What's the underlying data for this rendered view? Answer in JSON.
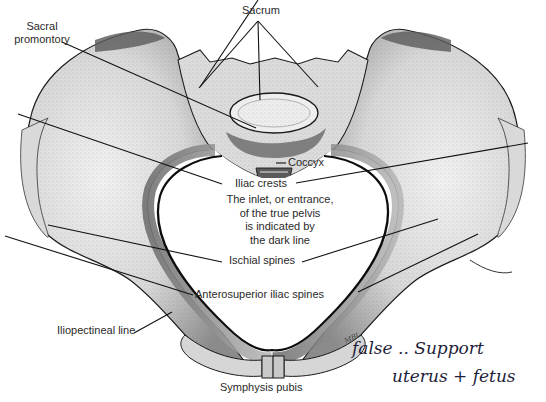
{
  "figure": {
    "labels": {
      "sacrum": "Sacrum",
      "sacral_promontory_line1": "Sacral",
      "sacral_promontory_line2": "promontory",
      "coccyx": "Coccyx",
      "iliac_crests": "Iliac crests",
      "caption_line1": "The inlet, or entrance,",
      "caption_line2": "of the true pelvis",
      "caption_line3": "is indicated by",
      "caption_line4": "the dark line",
      "ischial_spines": "Ischial spines",
      "anterosuperior_iliac_spines": "Anterosuperior iliac spines",
      "iliopectineal_line": "Iliopectineal line",
      "symphysis_pubis": "Symphysis pubis"
    },
    "artist_initials": "MBL",
    "handwritten_note": {
      "line1": "false .. Support",
      "line2": "uterus + fetus"
    },
    "colors": {
      "bone_fill": "#e4e4e4",
      "bone_shade": "#9a9a9a",
      "outline": "#1a1a1a",
      "leader_line": "#111111",
      "ink": "#1e1e3a"
    }
  }
}
